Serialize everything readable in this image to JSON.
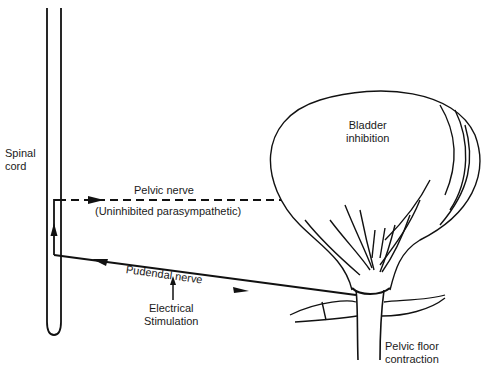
{
  "diagram": {
    "labels": {
      "spinal_cord": [
        "Spinal",
        "cord"
      ],
      "pelvic_nerve": "Pelvic nerve",
      "uninhibited": "(Uninhibited parasympathetic)",
      "pudendal_nerve": "Pudendal nerve",
      "electrical_stimulation": [
        "Electrical",
        "Stimulation"
      ],
      "bladder_inhibition": [
        "Bladder",
        "inhibition"
      ],
      "pelvic_floor": [
        "Pelvic floor",
        "contraction"
      ]
    },
    "colors": {
      "ink": "#111111",
      "background": "#ffffff"
    }
  }
}
